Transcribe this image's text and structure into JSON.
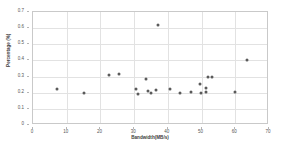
{
  "chart_data": {
    "type": "scatter",
    "title": "",
    "xlabel": "Bandwidth(MB/s)",
    "ylabel": "Percentage (%)",
    "xlim": [
      0,
      70
    ],
    "ylim": [
      0,
      0.7
    ],
    "xticks": [
      "0",
      "10",
      "20",
      "30",
      "40",
      "50",
      "60",
      "70"
    ],
    "yticks": [
      "0",
      "0.1",
      "0.2",
      "0.3",
      "0.4",
      "0.5",
      "0.6",
      "0.7"
    ],
    "grid": true,
    "legend": "none",
    "marker_color": "#5a5a5a",
    "series": [
      {
        "name": "samples",
        "points": [
          [
            7.0,
            0.222
          ],
          [
            15.0,
            0.198
          ],
          [
            22.5,
            0.308
          ],
          [
            25.5,
            0.315
          ],
          [
            30.5,
            0.225
          ],
          [
            31.0,
            0.193
          ],
          [
            33.5,
            0.285
          ],
          [
            34.0,
            0.212
          ],
          [
            35.0,
            0.197
          ],
          [
            36.5,
            0.215
          ],
          [
            37.2,
            0.62
          ],
          [
            40.5,
            0.222
          ],
          [
            43.5,
            0.2
          ],
          [
            47.0,
            0.207
          ],
          [
            49.5,
            0.253
          ],
          [
            49.8,
            0.198
          ],
          [
            51.2,
            0.232
          ],
          [
            51.3,
            0.202
          ],
          [
            52.0,
            0.295
          ],
          [
            53.2,
            0.295
          ],
          [
            60.0,
            0.203
          ],
          [
            63.5,
            0.4
          ]
        ]
      }
    ]
  },
  "axes": {
    "x_axis_name": "bandwidth-axis",
    "y_axis_name": "percentage-axis"
  }
}
